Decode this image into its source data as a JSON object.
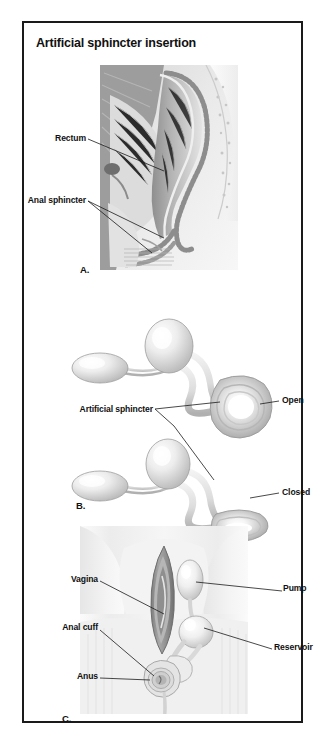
{
  "figure": {
    "title": "Artificial sphincter insertion"
  },
  "panels": [
    {
      "id": "panel-a",
      "letter": "A.",
      "caption_kind": "sagittal-anatomy",
      "labels": [
        {
          "name": "rectum",
          "text": "Rectum"
        },
        {
          "name": "anal-sphincter",
          "text": "Anal sphincter"
        }
      ]
    },
    {
      "id": "panel-b",
      "letter": "B.",
      "caption_kind": "device-diagram",
      "labels": [
        {
          "name": "artificial-sphincter",
          "text": "Artificial sphincter"
        },
        {
          "name": "open-state",
          "text": "Open"
        },
        {
          "name": "closed-state",
          "text": "Closed"
        }
      ]
    },
    {
      "id": "panel-c",
      "letter": "C.",
      "caption_kind": "perineal-anatomy",
      "labels": [
        {
          "name": "vagina",
          "text": "Vagina"
        },
        {
          "name": "pump",
          "text": "Pump"
        },
        {
          "name": "anal-cuff",
          "text": "Anal cuff"
        },
        {
          "name": "reservoir",
          "text": "Reservoir"
        },
        {
          "name": "anus",
          "text": "Anus"
        }
      ]
    }
  ],
  "colors": {
    "border": "#1a1a1a",
    "text": "#111111",
    "background": "#ffffff",
    "tissue_light": "#e8e8e8",
    "tissue_mid": "#b9b9b9",
    "tissue_dark": "#8a8a8a",
    "device_light": "#f2f2f2",
    "device_mid": "#cfcfcf"
  }
}
